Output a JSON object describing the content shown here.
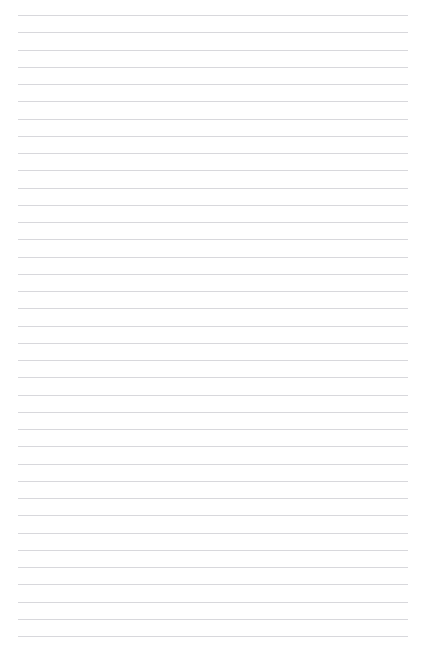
{
  "page": {
    "width": 426,
    "height": 651,
    "background_color": "#ffffff",
    "kind": "blank-ruled-paper",
    "content_text": ""
  },
  "ruling": {
    "line_color": "#d8d8dc",
    "line_thickness": 1,
    "line_count": 37,
    "first_line_y": 15,
    "line_spacing": 17.25,
    "left_margin": 18,
    "right_margin": 18,
    "line_start_x": 18,
    "line_end_x": 408,
    "line_length": 390,
    "has_vertical_margin_rule": false
  }
}
